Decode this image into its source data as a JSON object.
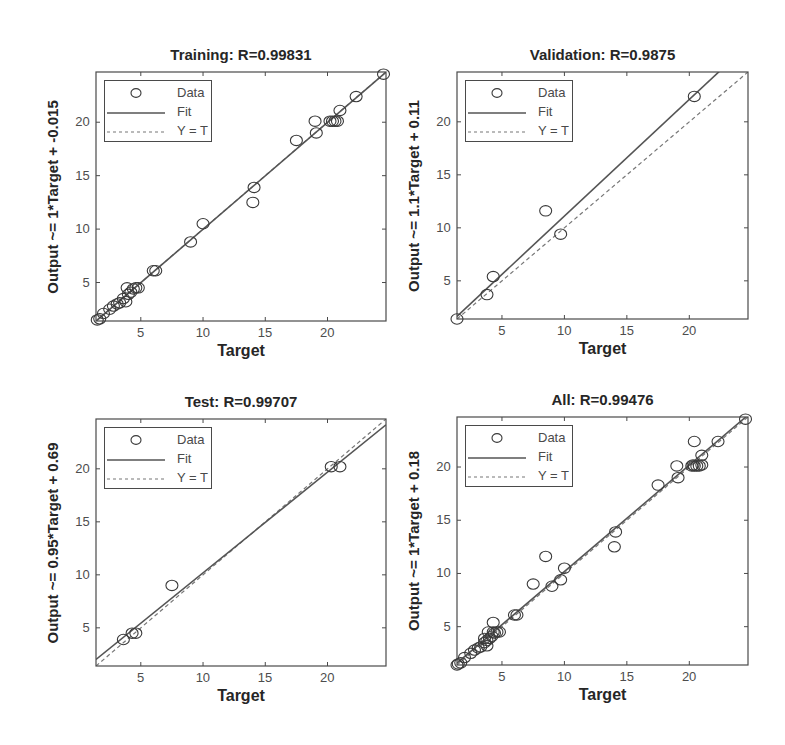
{
  "figure": {
    "width": 785,
    "height": 745,
    "colors": {
      "text": "#262626",
      "axis": "#4a4a4a",
      "data_marker": "#3a3a3a",
      "fit_line": "#555555",
      "identity_line": "#777777",
      "background": "#ffffff"
    }
  },
  "chart_data": [
    {
      "type": "scatter",
      "id": "training",
      "title": "Training: R=0.99831",
      "xlabel": "Target",
      "ylabel": "Output ~= 1*Target + -0.015",
      "R": 0.99831,
      "fit": {
        "slope": 1.0,
        "intercept": -0.015
      },
      "xlim": [
        1.4,
        24.7
      ],
      "ylim": [
        1.4,
        24.7
      ],
      "xticks": [
        5,
        10,
        15,
        20
      ],
      "yticks": [
        5,
        10,
        15,
        20
      ],
      "legend": [
        "Data",
        "Fit",
        "Y = T"
      ],
      "legend_position": "northwest",
      "grid": false,
      "points": [
        [
          1.5,
          1.5
        ],
        [
          1.7,
          1.6
        ],
        [
          2.0,
          2.1
        ],
        [
          2.5,
          2.5
        ],
        [
          2.8,
          2.8
        ],
        [
          3.1,
          3.0
        ],
        [
          3.3,
          3.1
        ],
        [
          3.6,
          3.5
        ],
        [
          3.8,
          3.2
        ],
        [
          3.9,
          4.5
        ],
        [
          4.0,
          3.9
        ],
        [
          4.2,
          4.1
        ],
        [
          4.4,
          4.4
        ],
        [
          4.6,
          4.5
        ],
        [
          4.8,
          4.5
        ],
        [
          6.0,
          6.1
        ],
        [
          6.2,
          6.1
        ],
        [
          9.0,
          8.8
        ],
        [
          10.0,
          10.5
        ],
        [
          14.0,
          12.5
        ],
        [
          14.1,
          13.9
        ],
        [
          17.5,
          18.3
        ],
        [
          19.0,
          20.1
        ],
        [
          19.1,
          19.0
        ],
        [
          20.2,
          20.1
        ],
        [
          20.4,
          20.1
        ],
        [
          20.6,
          20.1
        ],
        [
          20.8,
          20.1
        ],
        [
          21.0,
          21.1
        ],
        [
          22.3,
          22.4
        ],
        [
          24.5,
          24.5
        ]
      ]
    },
    {
      "type": "scatter",
      "id": "validation",
      "title": "Validation: R=0.9875",
      "xlabel": "Target",
      "ylabel": "Output ~= 1.1*Target + 0.11",
      "R": 0.9875,
      "fit": {
        "slope": 1.1,
        "intercept": 0.11
      },
      "xlim": [
        1.4,
        24.7
      ],
      "ylim": [
        1.4,
        24.7
      ],
      "xticks": [
        5,
        10,
        15,
        20
      ],
      "yticks": [
        5,
        10,
        15,
        20
      ],
      "legend": [
        "Data",
        "Fit",
        "Y = T"
      ],
      "legend_position": "northwest",
      "grid": false,
      "points": [
        [
          1.4,
          1.4
        ],
        [
          3.8,
          3.7
        ],
        [
          4.3,
          5.4
        ],
        [
          8.5,
          11.6
        ],
        [
          9.7,
          9.4
        ],
        [
          20.4,
          22.4
        ]
      ]
    },
    {
      "type": "scatter",
      "id": "test",
      "title": "Test: R=0.99707",
      "xlabel": "Target",
      "ylabel": "Output ~= 0.95*Target + 0.69",
      "R": 0.99707,
      "fit": {
        "slope": 0.95,
        "intercept": 0.69
      },
      "xlim": [
        1.4,
        24.7
      ],
      "ylim": [
        1.4,
        24.7
      ],
      "xticks": [
        5,
        10,
        15,
        20
      ],
      "yticks": [
        5,
        10,
        15,
        20
      ],
      "legend": [
        "Data",
        "Fit",
        "Y = T"
      ],
      "legend_position": "northwest",
      "grid": false,
      "points": [
        [
          3.6,
          3.9
        ],
        [
          4.3,
          4.5
        ],
        [
          4.6,
          4.5
        ],
        [
          7.5,
          9.0
        ],
        [
          20.3,
          20.2
        ],
        [
          21.0,
          20.2
        ]
      ]
    },
    {
      "type": "scatter",
      "id": "all",
      "title": "All: R=0.99476",
      "xlabel": "Target",
      "ylabel": "Output ~= 1*Target + 0.18",
      "R": 0.99476,
      "fit": {
        "slope": 1.0,
        "intercept": 0.18
      },
      "xlim": [
        1.4,
        24.7
      ],
      "ylim": [
        1.4,
        24.7
      ],
      "xticks": [
        5,
        10,
        15,
        20
      ],
      "yticks": [
        5,
        10,
        15,
        20
      ],
      "legend": [
        "Data",
        "Fit",
        "Y = T"
      ],
      "legend_position": "northwest",
      "grid": false,
      "points": [
        [
          1.4,
          1.4
        ],
        [
          1.5,
          1.5
        ],
        [
          1.7,
          1.6
        ],
        [
          2.0,
          2.1
        ],
        [
          2.5,
          2.5
        ],
        [
          2.8,
          2.8
        ],
        [
          3.1,
          3.0
        ],
        [
          3.3,
          3.1
        ],
        [
          3.6,
          3.5
        ],
        [
          3.6,
          3.9
        ],
        [
          3.8,
          3.2
        ],
        [
          3.8,
          3.7
        ],
        [
          3.9,
          4.5
        ],
        [
          4.0,
          3.9
        ],
        [
          4.2,
          4.1
        ],
        [
          4.3,
          4.5
        ],
        [
          4.3,
          5.4
        ],
        [
          4.4,
          4.4
        ],
        [
          4.6,
          4.5
        ],
        [
          4.8,
          4.5
        ],
        [
          6.0,
          6.1
        ],
        [
          6.2,
          6.1
        ],
        [
          7.5,
          9.0
        ],
        [
          8.5,
          11.6
        ],
        [
          9.0,
          8.8
        ],
        [
          9.7,
          9.4
        ],
        [
          10.0,
          10.5
        ],
        [
          14.0,
          12.5
        ],
        [
          14.1,
          13.9
        ],
        [
          17.5,
          18.3
        ],
        [
          19.0,
          20.1
        ],
        [
          19.1,
          19.0
        ],
        [
          20.2,
          20.1
        ],
        [
          20.3,
          20.2
        ],
        [
          20.4,
          22.4
        ],
        [
          20.4,
          20.1
        ],
        [
          20.6,
          20.1
        ],
        [
          20.8,
          20.1
        ],
        [
          21.0,
          20.2
        ],
        [
          21.0,
          21.1
        ],
        [
          22.3,
          22.4
        ],
        [
          24.5,
          24.5
        ]
      ]
    }
  ],
  "layout": {
    "panels": [
      {
        "left": 96,
        "top": 72,
        "right": 386,
        "bottom": 321,
        "title_y": 46,
        "ylabel_x": 52
      },
      {
        "left": 457,
        "top": 72,
        "right": 748,
        "bottom": 319,
        "title_y": 46,
        "ylabel_x": 413
      },
      {
        "left": 96,
        "top": 419,
        "right": 386,
        "bottom": 666,
        "title_y": 393,
        "ylabel_x": 52
      },
      {
        "left": 457,
        "top": 417,
        "right": 748,
        "bottom": 665,
        "title_y": 391,
        "ylabel_x": 413
      }
    ]
  }
}
